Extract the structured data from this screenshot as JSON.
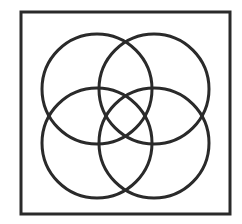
{
  "diagram": {
    "type": "four-circle-venn",
    "stroke_color": "#2a2a2a",
    "background": "#ffffff",
    "frame": {
      "x": 21,
      "y": 12,
      "width": 209,
      "height": 202,
      "stroke_width": 3
    },
    "circles": [
      {
        "name": "top-left",
        "cx": 97,
        "cy": 89,
        "r": 55
      },
      {
        "name": "top-right",
        "cx": 154,
        "cy": 89,
        "r": 55
      },
      {
        "name": "bottom-left",
        "cx": 97,
        "cy": 143,
        "r": 55
      },
      {
        "name": "bottom-right",
        "cx": 154,
        "cy": 143,
        "r": 55
      }
    ],
    "circle_stroke_width": 3
  }
}
